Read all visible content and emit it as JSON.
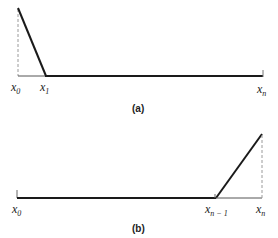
{
  "panels": [
    {
      "id": "a",
      "caption": "(a)",
      "labels": [
        {
          "base": "x",
          "sub": "0"
        },
        {
          "base": "x",
          "sub": "1"
        },
        {
          "base": "x",
          "sub": "n"
        }
      ],
      "description": "Hat basis function at left endpoint x0: peak at x0 decreasing linearly to zero at x1, zero thereafter to xn"
    },
    {
      "id": "b",
      "caption": "(b)",
      "labels": [
        {
          "base": "x",
          "sub": "0"
        },
        {
          "base": "x",
          "sub": "n − 1"
        },
        {
          "base": "x",
          "sub": "n"
        }
      ],
      "description": "Hat basis function at right endpoint xn: zero from x0 to x(n-1), rising linearly to peak at xn"
    }
  ],
  "colors": {
    "line": "#1a1a1a",
    "dashed": "#9a9a9a"
  }
}
